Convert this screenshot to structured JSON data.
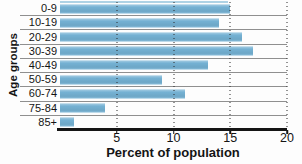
{
  "chart_data": {
    "type": "bar",
    "orientation": "horizontal",
    "title": "",
    "categories": [
      "0-9",
      "10-19",
      "20-29",
      "30-39",
      "40-49",
      "50-59",
      "60-74",
      "75-84",
      "85+"
    ],
    "values": [
      15,
      14,
      16,
      17,
      13,
      9,
      11,
      4,
      1.2
    ],
    "xlabel": "Percent of population",
    "ylabel": "Age groups",
    "xlim": [
      0,
      20
    ],
    "x_ticks": [
      5,
      10,
      15,
      20
    ],
    "grid": "vertical-dotted-over-bars",
    "row_separators": true,
    "legend": "none",
    "bar_color": "#74b1d3",
    "separator_color": "#8f8f8f",
    "axis_color": "#151515"
  }
}
